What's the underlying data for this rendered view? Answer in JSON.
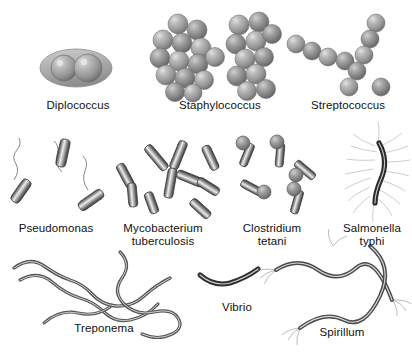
{
  "figure": {
    "background_color": "#ffffff",
    "ink_color": "#101010",
    "cell_fill": "#9a9a9a",
    "cell_highlight": "#d8d8d8",
    "cell_shadow": "#5a5a5a"
  },
  "organisms": [
    {
      "id": "diplococcus",
      "label": "Diplococcus",
      "shape": "diplococci",
      "description": "two cocci paired inside a shared capsule",
      "label_x": 78,
      "label_y": 105,
      "row": 1
    },
    {
      "id": "staphylococcus",
      "label": "Staphylococcus",
      "shape": "cocci-cluster",
      "description": "irregular grape-like clusters of cocci",
      "label_x": 220,
      "label_y": 105,
      "row": 1
    },
    {
      "id": "streptococcus",
      "label": "Streptococcus",
      "shape": "cocci-chain",
      "description": "branching chains of cocci",
      "label_x": 348,
      "label_y": 105,
      "row": 1
    },
    {
      "id": "pseudomonas",
      "label": "Pseudomonas",
      "shape": "bacillus-polar-flagellum",
      "description": "rods with single wavy polar flagellum",
      "label_x": 56,
      "label_y": 228,
      "row": 2
    },
    {
      "id": "mycobacterium-tuberculosis",
      "label": "Mycobacterium\ntuberculosis",
      "shape": "bacillus-scattered",
      "description": "scattered slender rods, some angled in clusters",
      "label_x": 163,
      "label_y": 228,
      "row": 2
    },
    {
      "id": "clostridium-tetani",
      "label": "Clostridium\ntetani",
      "shape": "bacillus-terminal-spore",
      "description": "drumstick rods with round terminal endospore",
      "label_x": 272,
      "label_y": 228,
      "row": 2
    },
    {
      "id": "salmonella-typhi",
      "label": "Salmonella\ntyphi",
      "shape": "bacillus-peritrichous",
      "description": "curved rod surrounded by peritrichous flagella",
      "label_x": 372,
      "label_y": 228,
      "row": 2
    },
    {
      "id": "treponema",
      "label": "Treponema",
      "shape": "spirochete",
      "description": "long flexible helical spirochete filaments",
      "label_x": 104,
      "label_y": 328,
      "row": 3
    },
    {
      "id": "vibrio",
      "label": "Vibrio",
      "shape": "comma-rod",
      "description": "short comma-shaped curved rod",
      "label_x": 237,
      "label_y": 307,
      "row": 3
    },
    {
      "id": "spirillum",
      "label": "Spirillum",
      "shape": "spiral-tufted-flagella",
      "description": "rigid spiral rods with tufts of polar flagella",
      "label_x": 342,
      "label_y": 332,
      "row": 3
    }
  ]
}
